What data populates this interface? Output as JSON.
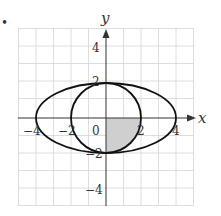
{
  "figure": {
    "bullet": "•",
    "x_axis_label": "x",
    "y_axis_label": "y",
    "origin_label": "0",
    "x_tick_labels": [
      {
        "value": -4,
        "label": "−4"
      },
      {
        "value": -2,
        "label": "−2"
      },
      {
        "value": 2,
        "label": "2"
      },
      {
        "value": 4,
        "label": "4"
      }
    ],
    "y_tick_labels": [
      {
        "value": 4,
        "label": "4"
      },
      {
        "value": 2,
        "label": "2"
      },
      {
        "value": -2,
        "label": "−2"
      },
      {
        "value": -4,
        "label": "−4"
      }
    ],
    "grid": {
      "xmin": -5,
      "xmax": 5,
      "ymin": -5,
      "ymax": 5,
      "step": 1
    },
    "curves": [
      {
        "name": "ellipse",
        "equation": "x^2/16 + y^2/4 = 1",
        "a": 4,
        "b": 2
      },
      {
        "name": "circle",
        "equation": "x^2 + y^2 = 4",
        "r": 2
      }
    ],
    "shaded_region": "fourth-quadrant quarter disk of circle r=2 (x from 0 to 2, y from -2 to 0)",
    "colors": {
      "curve": "#111111",
      "grid": "#d6d6d6",
      "axis": "#333333",
      "shade": "#cfcfcf"
    }
  }
}
